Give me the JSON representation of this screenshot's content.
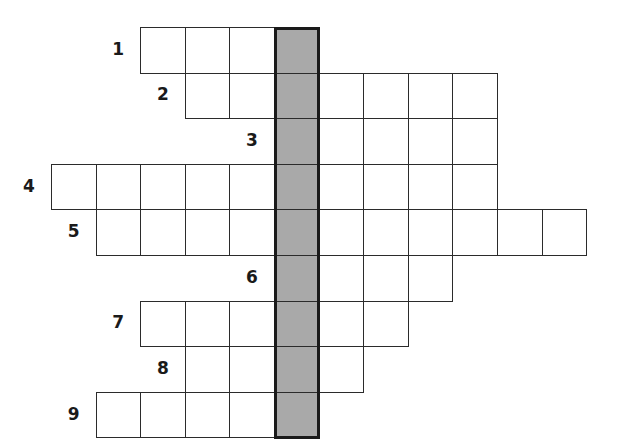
{
  "puzzle": {
    "type": "crossword-acrostic",
    "grid": {
      "origin_x": 51,
      "origin_y": 27,
      "cell_width": 44.6,
      "cell_height": 45.6,
      "shaded_column": 5,
      "shaded_color": "#a9a9a9",
      "line_color": "#2b2b2b"
    },
    "rows": [
      {
        "label": "1",
        "start_col": 2,
        "end_col": 5
      },
      {
        "label": "2",
        "start_col": 3,
        "end_col": 9
      },
      {
        "label": "3",
        "start_col": 5,
        "end_col": 9
      },
      {
        "label": "4",
        "start_col": 0,
        "end_col": 9
      },
      {
        "label": "5",
        "start_col": 1,
        "end_col": 11
      },
      {
        "label": "6",
        "start_col": 5,
        "end_col": 8
      },
      {
        "label": "7",
        "start_col": 2,
        "end_col": 7
      },
      {
        "label": "8",
        "start_col": 3,
        "end_col": 6
      },
      {
        "label": "9",
        "start_col": 1,
        "end_col": 5
      }
    ]
  }
}
